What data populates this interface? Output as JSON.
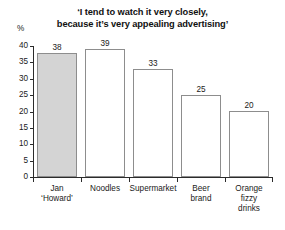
{
  "chart_data": {
    "type": "bar",
    "title": "‘I tend to watch it very closely, because it’s very appealing advertising’",
    "title_lines": [
      "‘I tend to watch it very closely,",
      "because it’s very appealing advertising’"
    ],
    "categories": [
      "Jan ‘Howard’",
      "Noodles",
      "Supermarket",
      "Beer brand",
      "Orange fizzy drinks"
    ],
    "category_lines": [
      [
        "Jan",
        "‘Howard’"
      ],
      [
        "Noodles"
      ],
      [
        "Supermarket"
      ],
      [
        "Beer",
        "brand"
      ],
      [
        "Orange",
        "fizzy",
        "drinks"
      ]
    ],
    "values": [
      38,
      39,
      33,
      25,
      20
    ],
    "value_labels": [
      "38",
      "39",
      "33",
      "25",
      "20"
    ],
    "highlighted_index": 0,
    "xlabel": "",
    "ylabel": "%",
    "ylim": [
      0,
      40
    ],
    "yticks": [
      0,
      5,
      10,
      15,
      20,
      25,
      30,
      35,
      40
    ],
    "ytick_labels": [
      "0",
      "5",
      "10",
      "15",
      "20",
      "25",
      "30",
      "35",
      "40"
    ],
    "grid": false,
    "legend": false,
    "colors": {
      "highlight_fill": "#d4d4d4",
      "bar_fill": "#ffffff",
      "bar_stroke": "#8d8d8d",
      "axis": "#2b2b2b",
      "text": "#1a1a1a",
      "background": "#ffffff"
    }
  }
}
